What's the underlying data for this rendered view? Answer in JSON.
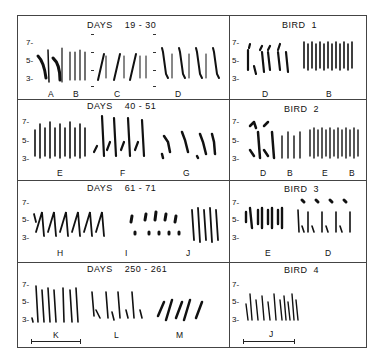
{
  "figure": {
    "left_column": {
      "panels": [
        {
          "title": "DAYS    19 - 30",
          "labels": [
            "A",
            "B",
            "C",
            "D"
          ]
        },
        {
          "title": "DAYS    40 - 51",
          "labels": [
            "E",
            "F",
            "G"
          ]
        },
        {
          "title": "DAYS    61 - 71",
          "labels": [
            "H",
            "I",
            "J"
          ]
        },
        {
          "title": "DAYS    250 - 261",
          "labels": [
            "K",
            "L",
            "M"
          ]
        }
      ]
    },
    "right_column": {
      "panels": [
        {
          "title": "BIRD  1",
          "labels": [
            "D",
            "B"
          ]
        },
        {
          "title": "BIRD  2",
          "labels": [
            "D",
            "B",
            "E",
            "B"
          ]
        },
        {
          "title": "BIRD  3",
          "labels": [
            "E",
            "D"
          ]
        },
        {
          "title": "BIRD  4",
          "labels": [
            "J"
          ]
        }
      ]
    },
    "y_axis_ticks": [
      "7-",
      "5-",
      "3-"
    ],
    "scale_bar": "time scale bar (unlabeled)"
  }
}
